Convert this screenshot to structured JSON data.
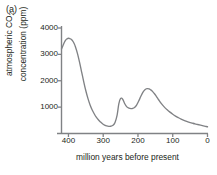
{
  "figure": {
    "panel_label": "(a)"
  },
  "chart_data": {
    "type": "line",
    "title": "",
    "panel": "(a)",
    "xlabel": "million years before present",
    "ylabel": "atmospheric CO2 concentration (ppm)",
    "ylabel_line1": "atmospheric CO",
    "ylabel_sub": "2",
    "ylabel_line2": "concentration (ppm)",
    "xlim": [
      420,
      0
    ],
    "ylim": [
      0,
      4200
    ],
    "x_reversed": true,
    "grid": false,
    "legend": false,
    "xticks": [
      400,
      300,
      200,
      100,
      0
    ],
    "xtick_labels": [
      "400",
      "300",
      "200",
      "100",
      "0"
    ],
    "yticks": [
      1000,
      2000,
      3000,
      4000
    ],
    "ytick_labels": [
      "1000",
      "2000",
      "3000",
      "4000"
    ],
    "line_color": "#808285",
    "axis_color": "#808285",
    "series": [
      {
        "name": "atmospheric CO2",
        "x": [
          420,
          416,
          412,
          408,
          404,
          400,
          396,
          392,
          388,
          384,
          380,
          374,
          368,
          362,
          356,
          350,
          344,
          338,
          332,
          326,
          320,
          314,
          308,
          302,
          296,
          290,
          284,
          278,
          272,
          266,
          260,
          255,
          250,
          244,
          238,
          232,
          226,
          220,
          215,
          210,
          204,
          198,
          192,
          186,
          180,
          174,
          168,
          164,
          160,
          154,
          148,
          140,
          132,
          124,
          116,
          108,
          100,
          92,
          84,
          76,
          68,
          60,
          52,
          44,
          36,
          28,
          20,
          12,
          4,
          0
        ],
        "y": [
          3200,
          3330,
          3450,
          3540,
          3590,
          3610,
          3600,
          3570,
          3510,
          3420,
          3290,
          3030,
          2700,
          2330,
          1960,
          1620,
          1330,
          1090,
          900,
          750,
          620,
          520,
          440,
          370,
          320,
          285,
          270,
          275,
          310,
          420,
          700,
          1130,
          1330,
          1300,
          1130,
          1010,
          960,
          945,
          950,
          985,
          1080,
          1230,
          1400,
          1560,
          1660,
          1700,
          1690,
          1660,
          1620,
          1530,
          1430,
          1270,
          1120,
          1000,
          900,
          810,
          730,
          660,
          600,
          545,
          500,
          460,
          425,
          395,
          365,
          340,
          315,
          290,
          265,
          255
        ]
      }
    ],
    "annotations": []
  }
}
